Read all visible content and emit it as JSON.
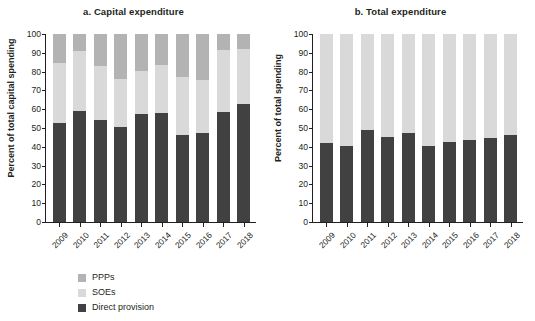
{
  "figure": {
    "panels": [
      {
        "id": "panel-a",
        "title": "a. Capital expenditure",
        "ylabel": "Percent of total capital spending",
        "legend": [
          {
            "key": "ppps",
            "label": "PPPs",
            "color": "#b3b3b3"
          },
          {
            "key": "soes",
            "label": "SOEs",
            "color": "#d9d9d9"
          },
          {
            "key": "direct",
            "label": "Direct provision",
            "color": "#414141"
          }
        ]
      },
      {
        "id": "panel-b",
        "title": "b. Total expenditure",
        "ylabel": "Percent of total spending",
        "legend": [
          {
            "key": "soes",
            "label": "SOEs",
            "color": "#d9d9d9"
          },
          {
            "key": "direct",
            "label": "Direct provision",
            "color": "#414141"
          }
        ]
      }
    ]
  },
  "chart_data": [
    {
      "type": "bar",
      "stacked": true,
      "title": "a. Capital expenditure",
      "xlabel": "",
      "ylabel": "Percent of total capital spending",
      "ylim": [
        0,
        100
      ],
      "yticks": [
        0,
        10,
        20,
        30,
        40,
        50,
        60,
        70,
        80,
        90,
        100
      ],
      "grid": false,
      "legend_position": "below-left",
      "categories": [
        "2009",
        "2010",
        "2011",
        "2012",
        "2013",
        "2014",
        "2015",
        "2016",
        "2017",
        "2018"
      ],
      "series": [
        {
          "name": "Direct provision",
          "color": "#414141",
          "values": [
            52.5,
            59.0,
            54.0,
            50.5,
            57.5,
            58.0,
            46.5,
            47.5,
            58.5,
            63.0
          ]
        },
        {
          "name": "SOEs",
          "color": "#d9d9d9",
          "values": [
            32.0,
            32.0,
            29.0,
            25.5,
            23.0,
            25.5,
            30.5,
            28.0,
            33.0,
            29.0
          ]
        },
        {
          "name": "PPPs",
          "color": "#b3b3b3",
          "values": [
            15.5,
            9.0,
            17.0,
            24.0,
            19.5,
            16.5,
            23.0,
            24.5,
            8.5,
            8.0
          ]
        }
      ],
      "cumulative_tops": {
        "direct": [
          52.5,
          59.0,
          54.0,
          50.5,
          57.5,
          58.0,
          46.5,
          47.5,
          58.5,
          63.0
        ],
        "soes": [
          84.5,
          91.0,
          83.0,
          76.0,
          80.5,
          83.5,
          77.0,
          75.5,
          91.5,
          92.0
        ],
        "ppps": [
          100,
          100,
          100,
          100,
          100,
          100,
          100,
          100,
          100,
          100
        ]
      }
    },
    {
      "type": "bar",
      "stacked": true,
      "title": "b. Total expenditure",
      "xlabel": "",
      "ylabel": "Percent of total spending",
      "ylim": [
        0,
        100
      ],
      "yticks": [
        0,
        10,
        20,
        30,
        40,
        50,
        60,
        70,
        80,
        90,
        100
      ],
      "grid": false,
      "legend_position": "below-left",
      "categories": [
        "2009",
        "2010",
        "2011",
        "2012",
        "2013",
        "2014",
        "2015",
        "2016",
        "2017",
        "2018"
      ],
      "series": [
        {
          "name": "Direct provision",
          "color": "#414141",
          "values": [
            42.0,
            40.5,
            49.0,
            45.0,
            47.5,
            40.5,
            42.5,
            43.5,
            44.5,
            46.5
          ]
        },
        {
          "name": "SOEs",
          "color": "#d9d9d9",
          "values": [
            58.0,
            59.5,
            51.0,
            55.0,
            52.5,
            59.5,
            57.5,
            56.5,
            55.5,
            53.5
          ]
        }
      ],
      "cumulative_tops": {
        "direct": [
          42.0,
          40.5,
          49.0,
          45.0,
          47.5,
          40.5,
          42.5,
          43.5,
          44.5,
          46.5
        ],
        "soes": [
          100,
          100,
          100,
          100,
          100,
          100,
          100,
          100,
          100,
          100
        ]
      }
    }
  ]
}
